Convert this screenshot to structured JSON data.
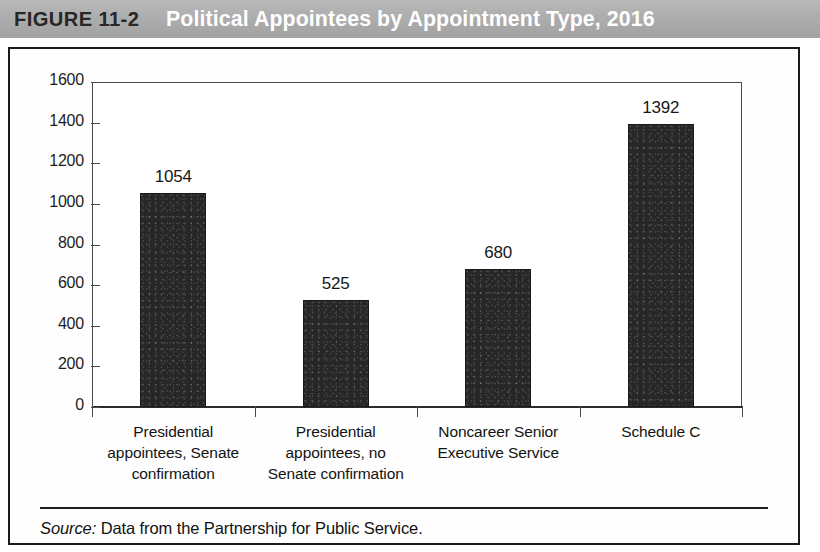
{
  "figure": {
    "number": "FIGURE 11-2",
    "title": "Political Appointees by Appointment Type, 2016",
    "banner_color": "#adadad",
    "title_color": "#ffffff",
    "number_color": "#272727"
  },
  "source": {
    "label": "Source:",
    "text": "Data from the Partnership for Public Service."
  },
  "chart_data": {
    "type": "bar",
    "title": "Political Appointees by Appointment Type, 2016",
    "xlabel": "",
    "ylabel": "",
    "categories": [
      "Presidential appointees, Senate confirmation",
      "Presidential appointees, no Senate confirmation",
      "Noncareer Senior Executive Service",
      "Schedule C"
    ],
    "category_lines": [
      [
        "Presidential",
        "appointees, Senate",
        "confirmation"
      ],
      [
        "Presidential",
        "appointees, no",
        "Senate confirmation"
      ],
      [
        "Noncareer Senior",
        "Executive Service"
      ],
      [
        "Schedule C"
      ]
    ],
    "values": [
      1054,
      525,
      680,
      1392
    ],
    "value_labels": [
      "1054",
      "525",
      "680",
      "1392"
    ],
    "ylim": [
      0,
      1600
    ],
    "ytick_values": [
      1600,
      1400,
      1200,
      1000,
      800,
      600,
      400,
      200,
      0
    ],
    "ytick_labels": [
      "1600",
      "1400",
      "1200",
      "1000",
      "800",
      "600",
      "400",
      "200",
      "0"
    ],
    "grid": false,
    "legend": false,
    "bar_color": "#272727",
    "axis_color": "#4a4a4a"
  }
}
